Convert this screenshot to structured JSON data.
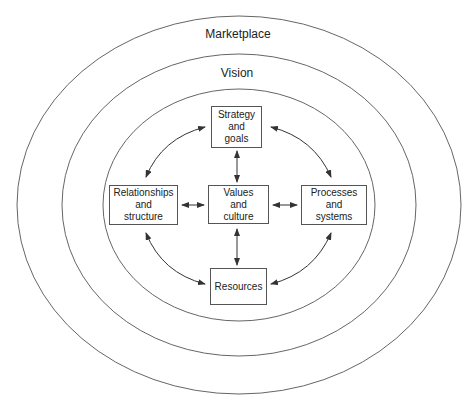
{
  "rings": [
    {
      "label": "Marketplace",
      "cx": 239,
      "cy": 205,
      "rx": 222,
      "ry": 189
    },
    {
      "label": "Vision",
      "cx": 239,
      "cy": 205,
      "rx": 177,
      "ry": 151
    },
    {
      "label": "",
      "cx": 239,
      "cy": 205,
      "rx": 136,
      "ry": 116
    }
  ],
  "boxes": {
    "strategy": {
      "label": "Strategy\nand\ngoals"
    },
    "relationships": {
      "label": "Relationships\nand\nstructure"
    },
    "values": {
      "label": "Values\nand\nculture"
    },
    "processes": {
      "label": "Processes\nand\nsystems"
    },
    "resources": {
      "label": "Resources"
    }
  },
  "connections": [
    {
      "from": "values",
      "to": "strategy",
      "type": "bidirectional-straight"
    },
    {
      "from": "values",
      "to": "resources",
      "type": "bidirectional-straight"
    },
    {
      "from": "values",
      "to": "relationships",
      "type": "bidirectional-straight"
    },
    {
      "from": "values",
      "to": "processes",
      "type": "bidirectional-straight"
    },
    {
      "from": "relationships",
      "to": "strategy",
      "type": "bidirectional-curved"
    },
    {
      "from": "strategy",
      "to": "processes",
      "type": "bidirectional-curved"
    },
    {
      "from": "relationships",
      "to": "resources",
      "type": "bidirectional-curved"
    },
    {
      "from": "processes",
      "to": "resources",
      "type": "bidirectional-curved"
    }
  ],
  "colors": {
    "line": "#555555",
    "text": "#222222",
    "background": "#ffffff"
  }
}
